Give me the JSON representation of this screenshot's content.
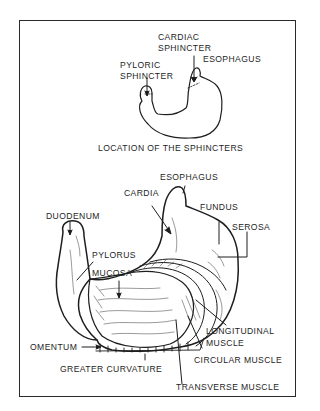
{
  "diagram": {
    "type": "anatomical illustration",
    "top_panel": {
      "caption": "LOCATION OF THE SPHINCTERS",
      "labels": {
        "cardiac_sphincter": [
          "CARDIAC",
          "SPHINCTER"
        ],
        "pyloric_sphincter": [
          "PYLORIC",
          "SPHINCTER"
        ],
        "esophagus": "ESOPHAGUS"
      }
    },
    "bottom_panel": {
      "labels": {
        "esophagus": "ESOPHAGUS",
        "cardia": "CARDIA",
        "fundus": "FUNDUS",
        "serosa": "SEROSA",
        "duodenum": "DUODENUM",
        "pylorus": "PYLORUS",
        "mucosa": "MUCOSA",
        "longitudinal_muscle": [
          "LONGITUDINAL",
          "MUSCLE"
        ],
        "omentum": "OMENTUM",
        "circular_muscle": "CIRCULAR MUSCLE",
        "greater_curvature": "GREATER CURVATURE",
        "transverse_muscle": "TRANSVERSE MUSCLE"
      }
    },
    "colors": {
      "line": "#1e1e1e",
      "background": "#ffffff"
    }
  }
}
